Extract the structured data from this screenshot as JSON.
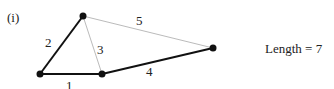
{
  "figure": {
    "label": "(i)",
    "result": "Length = 7"
  },
  "graph": {
    "nodes": [
      {
        "id": "A",
        "x": 40,
        "y": 74
      },
      {
        "id": "B",
        "x": 83,
        "y": 16
      },
      {
        "id": "C",
        "x": 102,
        "y": 74
      },
      {
        "id": "D",
        "x": 213,
        "y": 48
      }
    ],
    "edges": [
      {
        "from": "A",
        "to": "C",
        "weight": "1",
        "in_tree": true,
        "label_x": 66,
        "label_y": 79
      },
      {
        "from": "A",
        "to": "B",
        "weight": "2",
        "in_tree": true,
        "label_x": 45,
        "label_y": 36
      },
      {
        "from": "B",
        "to": "C",
        "weight": "3",
        "in_tree": false,
        "label_x": 97,
        "label_y": 43
      },
      {
        "from": "C",
        "to": "D",
        "weight": "4",
        "in_tree": true,
        "label_x": 146,
        "label_y": 65
      },
      {
        "from": "B",
        "to": "D",
        "weight": "5",
        "in_tree": false,
        "label_x": 136,
        "label_y": 14
      }
    ],
    "colors": {
      "tree_edge": "#111111",
      "non_tree_edge": "#bbbbbb",
      "node": "#111111"
    }
  }
}
